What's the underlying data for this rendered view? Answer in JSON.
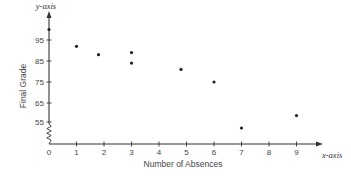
{
  "chart_data": {
    "type": "scatter",
    "title": "",
    "xlabel": "Number of Absences",
    "ylabel": "Final Grade",
    "x_axis_name": "x-axis",
    "y_axis_name": "y-axis",
    "x_ticks": [
      0,
      1,
      2,
      3,
      4,
      5,
      6,
      7,
      8,
      9
    ],
    "y_ticks": [
      55,
      65,
      75,
      85,
      95
    ],
    "xlim": [
      0,
      10
    ],
    "ylim": [
      50,
      102
    ],
    "y_axis_break": true,
    "grid": false,
    "legend": null,
    "points": [
      {
        "x": 0,
        "y": 100
      },
      {
        "x": 1,
        "y": 92
      },
      {
        "x": 1.8,
        "y": 88
      },
      {
        "x": 3,
        "y": 89
      },
      {
        "x": 3,
        "y": 84
      },
      {
        "x": 4.8,
        "y": 81
      },
      {
        "x": 6,
        "y": 75
      },
      {
        "x": 7,
        "y": 52
      },
      {
        "x": 9,
        "y": 59
      }
    ],
    "colors": {
      "axis": "#333333",
      "point": "#222222",
      "text": "#444444"
    }
  }
}
